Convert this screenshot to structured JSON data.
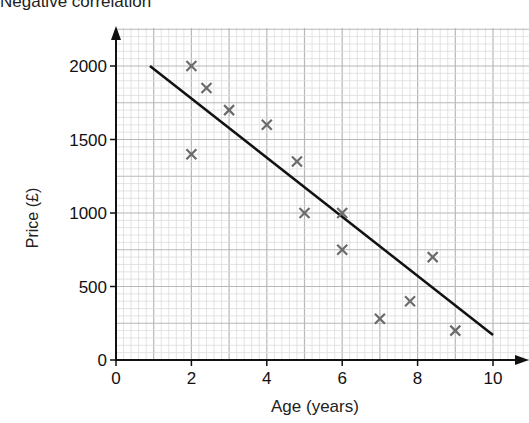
{
  "chart_data": {
    "type": "scatter",
    "title": "Negative correlation",
    "xlabel": "Age (years)",
    "ylabel": "Price (£)",
    "xlim": [
      0,
      10.7
    ],
    "ylim": [
      0,
      2200
    ],
    "x_ticks": [
      0,
      2,
      4,
      6,
      8,
      10
    ],
    "y_ticks": [
      0,
      500,
      1000,
      1500,
      2000
    ],
    "grid": true,
    "legend": null,
    "series": [
      {
        "name": "Cars",
        "marker": "x",
        "color": "#6b6b6b",
        "points": [
          {
            "x": 2,
            "y": 2000
          },
          {
            "x": 2,
            "y": 1400
          },
          {
            "x": 2.4,
            "y": 1850
          },
          {
            "x": 3,
            "y": 1700
          },
          {
            "x": 4,
            "y": 1600
          },
          {
            "x": 4.8,
            "y": 1350
          },
          {
            "x": 5,
            "y": 1000
          },
          {
            "x": 6,
            "y": 1000
          },
          {
            "x": 6,
            "y": 750
          },
          {
            "x": 7,
            "y": 280
          },
          {
            "x": 7.8,
            "y": 400
          },
          {
            "x": 8.4,
            "y": 700
          },
          {
            "x": 9,
            "y": 200
          }
        ]
      }
    ],
    "line_of_best_fit": {
      "color": "#111111",
      "start": {
        "x": 0.9,
        "y": 2000
      },
      "end": {
        "x": 10,
        "y": 170
      }
    }
  }
}
